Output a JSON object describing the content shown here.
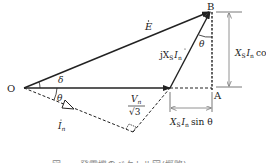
{
  "diagram": {
    "type": "phasor-diagram",
    "points": {
      "O": "O",
      "A": "A",
      "B": "B"
    },
    "vectors": {
      "E": "E",
      "jXsIn_prefix": "jX",
      "jXsIn_sub": "S",
      "jXsIn_I": "I",
      "jXsIn_isub": "n",
      "V_num": "V",
      "V_sub": "n",
      "V_den": "√3",
      "I": "I",
      "I_sub": "n"
    },
    "angles": {
      "delta": "δ",
      "theta_O": "θ",
      "theta_B": "θ"
    },
    "dimensions": {
      "vertical": {
        "X": "X",
        "X_sub": "S",
        "I": "I",
        "I_sub": "n",
        "func": "cos θ"
      },
      "horizontal": {
        "X": "X",
        "X_sub": "S",
        "I": "I",
        "I_sub": "n",
        "func": "sin θ"
      }
    },
    "colors": {
      "line": "#222222",
      "dim": "#777777",
      "caption": "#888888"
    }
  },
  "caption": {
    "text": "図 ─ ─ 発電機のベクトル図(概略)"
  }
}
